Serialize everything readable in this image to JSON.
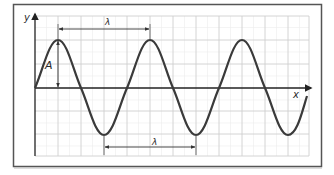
{
  "diagram": {
    "type": "transverse-wave",
    "labels": {
      "y_axis": "y",
      "x_axis": "x",
      "amplitude": "A",
      "wavelength_top": "λ",
      "wavelength_bottom": "λ"
    },
    "colors": {
      "wave": "#3a3a3a",
      "axis": "#222222",
      "grid_major": "#c8c8c8",
      "grid_minor": "#e6e6e6",
      "frame": "#555555",
      "arrow": "#333333"
    },
    "wave": {
      "cycles_shown": 3,
      "peaks_count": 3,
      "troughs_count": 3
    }
  }
}
